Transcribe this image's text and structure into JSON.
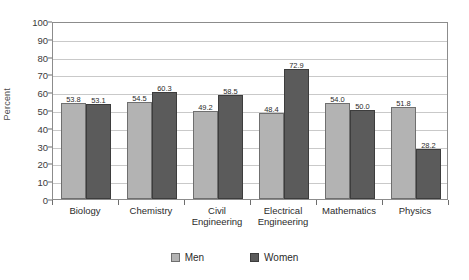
{
  "chart_data": {
    "type": "bar",
    "title": "",
    "xlabel": "",
    "ylabel": "Percent",
    "ylim": [
      0,
      100
    ],
    "ytick_step": 10,
    "yticks": [
      100,
      90,
      80,
      70,
      60,
      50,
      40,
      30,
      20,
      10,
      0
    ],
    "grid": true,
    "legend_position": "bottom-center",
    "categories": [
      "Biology",
      "Chemistry",
      "Civil\nEngineering",
      "Electrical\nEngineering",
      "Mathematics",
      "Physics"
    ],
    "series": [
      {
        "name": "Men",
        "color": "#b3b3b3",
        "values": [
          53.8,
          54.5,
          49.2,
          48.4,
          54.0,
          51.8
        ],
        "labels": [
          "53.8",
          "54.5",
          "49.2",
          "48.4",
          "54.0",
          "51.8"
        ]
      },
      {
        "name": "Women",
        "color": "#5b5b5b",
        "values": [
          53.1,
          60.3,
          58.5,
          72.9,
          50.0,
          28.2
        ],
        "labels": [
          "53.1",
          "60.3",
          "58.5",
          "72.9",
          "50.0",
          "28.2"
        ]
      }
    ]
  },
  "legend": {
    "items": [
      {
        "label": "Men",
        "key": "men"
      },
      {
        "label": "Women",
        "key": "women"
      }
    ]
  }
}
